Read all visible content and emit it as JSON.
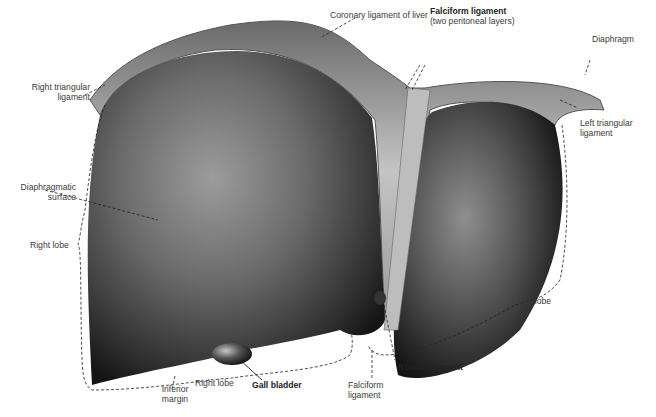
{
  "figure": {
    "colors": {
      "liver_dark": "#1e1e1e",
      "liver_light": "#9a9a9a",
      "ligament": "#b9b9b9",
      "background": "#ffffff",
      "label_text": "#3a3a3a"
    }
  },
  "labels": {
    "coronary": "Coronary ligament of liver",
    "falciform_top": "Falciform ligament",
    "falciform_top_sub": "(two peritoneal layers)",
    "diaphragm": "Diaphragm",
    "right_triangular_1": "Right triangular",
    "right_triangular_2": "ligament",
    "left_triangular_1": "Left triangular",
    "left_triangular_2": "ligament",
    "diaphragmatic_1": "Diaphragmatic",
    "diaphragmatic_2": "surface",
    "right_lobe_side": "Right lobe",
    "left_lobe": "Left lobe",
    "inferior_1": "Inferior",
    "inferior_2": "margin",
    "right_lobe_bottom": "Right lobe",
    "gall_bladder": "Gall bladder",
    "falciform_bottom_1": "Falciform",
    "falciform_bottom_2": "ligament",
    "round_ligament": "Round ligament"
  }
}
